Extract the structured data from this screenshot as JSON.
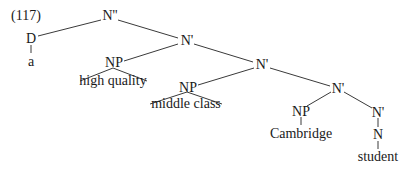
{
  "example_number": "(117)",
  "nodes": {
    "root": "N''",
    "det": "D",
    "det_word": "a",
    "nbar1": "N'",
    "np1": "NP",
    "np1_phrase": "high quality",
    "nbar2": "N'",
    "np2": "NP",
    "np2_phrase": "middle class",
    "nbar3": "N'",
    "np3": "NP",
    "np3_word": "Cambridge",
    "nbar4": "N'",
    "head_n": "N",
    "head_word": "student"
  }
}
